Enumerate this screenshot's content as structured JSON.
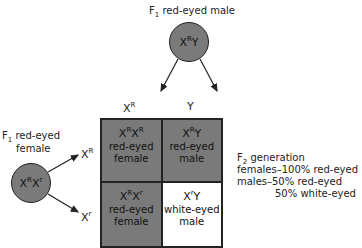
{
  "male_parent": {
    "label_prefix": "F",
    "label_sub": "1",
    "label_text": " red-eyed male",
    "genotype": {
      "base1": "X",
      "sup1": "R",
      "base2": "Y"
    }
  },
  "female_parent": {
    "label_prefix": "F",
    "label_sub": "1",
    "label_line1": " red-eyed",
    "label_line2": "female",
    "genotype": {
      "base1": "X",
      "sup1": "R",
      "base2": "X",
      "sup2": "r"
    }
  },
  "male_gametes": [
    {
      "base": "X",
      "sup": "R"
    },
    {
      "base": "Y",
      "sup": ""
    }
  ],
  "female_gametes": [
    {
      "base": "X",
      "sup": "R"
    },
    {
      "base": "X",
      "sup": "r"
    }
  ],
  "punnett": {
    "cells": [
      {
        "g1": "X",
        "s1": "R",
        "g2": "X",
        "s2": "R",
        "line1": "red-eyed",
        "line2": "female",
        "fill": "#7a7a7a"
      },
      {
        "g1": "X",
        "s1": "R",
        "g2": "Y",
        "s2": "",
        "line1": "red-eyed",
        "line2": "male",
        "fill": "#7a7a7a"
      },
      {
        "g1": "X",
        "s1": "R",
        "g2": "X",
        "s2": "r",
        "line1": "red-eyed",
        "line2": "female",
        "fill": "#7a7a7a"
      },
      {
        "g1": "X",
        "s1": "r",
        "g2": "Y",
        "s2": "",
        "line1": "white-eyed",
        "line2": "male",
        "fill": "#ffffff"
      }
    ]
  },
  "summary": {
    "title_prefix": "F",
    "title_sub": "2",
    "title_text": " generation",
    "line1": "females–100% red-eyed",
    "line2": "males–50% red-eyed",
    "line3": "50% white-eyed"
  },
  "colors": {
    "red_eyed_fill": "#7a7a7a",
    "white_eyed_fill": "#ffffff",
    "stroke": "#222222"
  }
}
